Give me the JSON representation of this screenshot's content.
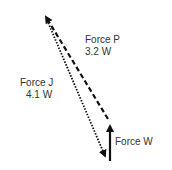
{
  "diagram": {
    "type": "force-vector-diagram",
    "forces": [
      {
        "name": "Force P",
        "magnitude": "3.2 W",
        "style": "dashed"
      },
      {
        "name": "Force J",
        "magnitude": "4.1 W",
        "style": "dotted"
      },
      {
        "name": "Force W",
        "magnitude": "",
        "style": "solid"
      }
    ],
    "labels": {
      "p_name": "Force P",
      "p_value": "3.2 W",
      "j_name": "Force J",
      "j_value": "4.1 W",
      "w_name": "Force W"
    },
    "colors": {
      "stroke": "#111111",
      "text": "#333333"
    }
  }
}
